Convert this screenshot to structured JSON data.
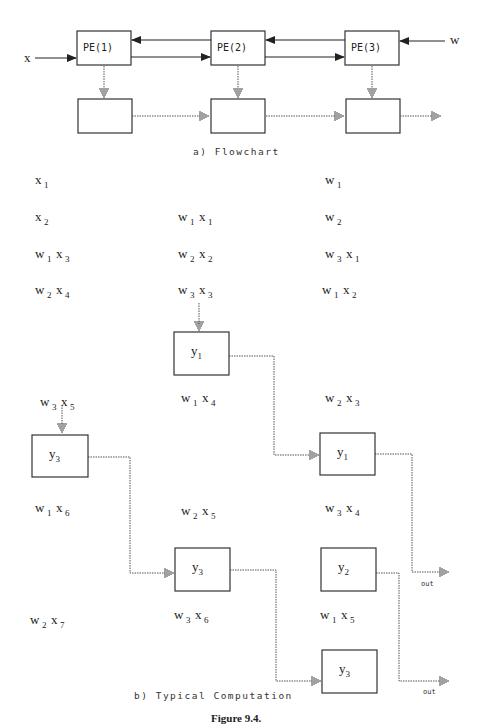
{
  "flowchart": {
    "input_x": "x",
    "input_w": "w",
    "processors": [
      {
        "label": "PE(1)"
      },
      {
        "label": "PE(2)"
      },
      {
        "label": "PE(3)"
      }
    ],
    "caption": "a)  Flowchart"
  },
  "computation": {
    "caption": "b)  Typical Computation",
    "terms": [
      {
        "id": "c1r1",
        "parts": [
          [
            "x",
            "1"
          ]
        ]
      },
      {
        "id": "c3r1",
        "parts": [
          [
            "w",
            "1"
          ]
        ]
      },
      {
        "id": "c1r2",
        "parts": [
          [
            "x",
            "2"
          ]
        ]
      },
      {
        "id": "c2r2",
        "parts": [
          [
            "w",
            "1"
          ],
          [
            "x",
            "1"
          ]
        ]
      },
      {
        "id": "c3r2",
        "parts": [
          [
            "w",
            "2"
          ]
        ]
      },
      {
        "id": "c1r3",
        "parts": [
          [
            "w",
            "1"
          ],
          [
            "x",
            "3"
          ]
        ]
      },
      {
        "id": "c2r3",
        "parts": [
          [
            "w",
            "2"
          ],
          [
            "x",
            "2"
          ]
        ]
      },
      {
        "id": "c3r3",
        "parts": [
          [
            "w",
            "3"
          ],
          [
            "x",
            "1"
          ]
        ]
      },
      {
        "id": "c1r4",
        "parts": [
          [
            "w",
            "2"
          ],
          [
            "x",
            "4"
          ]
        ]
      },
      {
        "id": "c2r4",
        "parts": [
          [
            "w",
            "3"
          ],
          [
            "x",
            "3"
          ]
        ]
      },
      {
        "id": "c3r4",
        "parts": [
          [
            "w",
            "1"
          ],
          [
            "x",
            "2"
          ]
        ]
      },
      {
        "id": "c2r5",
        "parts": [
          [
            "w",
            "1"
          ],
          [
            "x",
            "4"
          ]
        ]
      },
      {
        "id": "c3r5",
        "parts": [
          [
            "w",
            "2"
          ],
          [
            "x",
            "3"
          ]
        ]
      },
      {
        "id": "c1r5",
        "parts": [
          [
            "w",
            "3"
          ],
          [
            "x",
            "5"
          ]
        ]
      },
      {
        "id": "c1r6",
        "parts": [
          [
            "w",
            "1"
          ],
          [
            "x",
            "6"
          ]
        ]
      },
      {
        "id": "c2r6",
        "parts": [
          [
            "w",
            "2"
          ],
          [
            "x",
            "5"
          ]
        ]
      },
      {
        "id": "c3r6",
        "parts": [
          [
            "w",
            "3"
          ],
          [
            "x",
            "4"
          ]
        ]
      },
      {
        "id": "c1r7",
        "parts": [
          [
            "w",
            "2"
          ],
          [
            "x",
            "7"
          ]
        ]
      },
      {
        "id": "c2r7",
        "parts": [
          [
            "w",
            "3"
          ],
          [
            "x",
            "6"
          ]
        ]
      },
      {
        "id": "c3r7",
        "parts": [
          [
            "w",
            "1"
          ],
          [
            "x",
            "5"
          ]
        ]
      }
    ],
    "outputs": [
      {
        "id": "y1a",
        "base": "y",
        "sub": "1"
      },
      {
        "id": "y3a",
        "base": "y",
        "sub": "3"
      },
      {
        "id": "y1b",
        "base": "y",
        "sub": "1"
      },
      {
        "id": "y3b",
        "base": "y",
        "sub": "3"
      },
      {
        "id": "y2a",
        "base": "y",
        "sub": "2"
      },
      {
        "id": "y3c",
        "base": "y",
        "sub": "3"
      }
    ],
    "out_label": "out"
  },
  "figure_caption": "Figure 9.4."
}
